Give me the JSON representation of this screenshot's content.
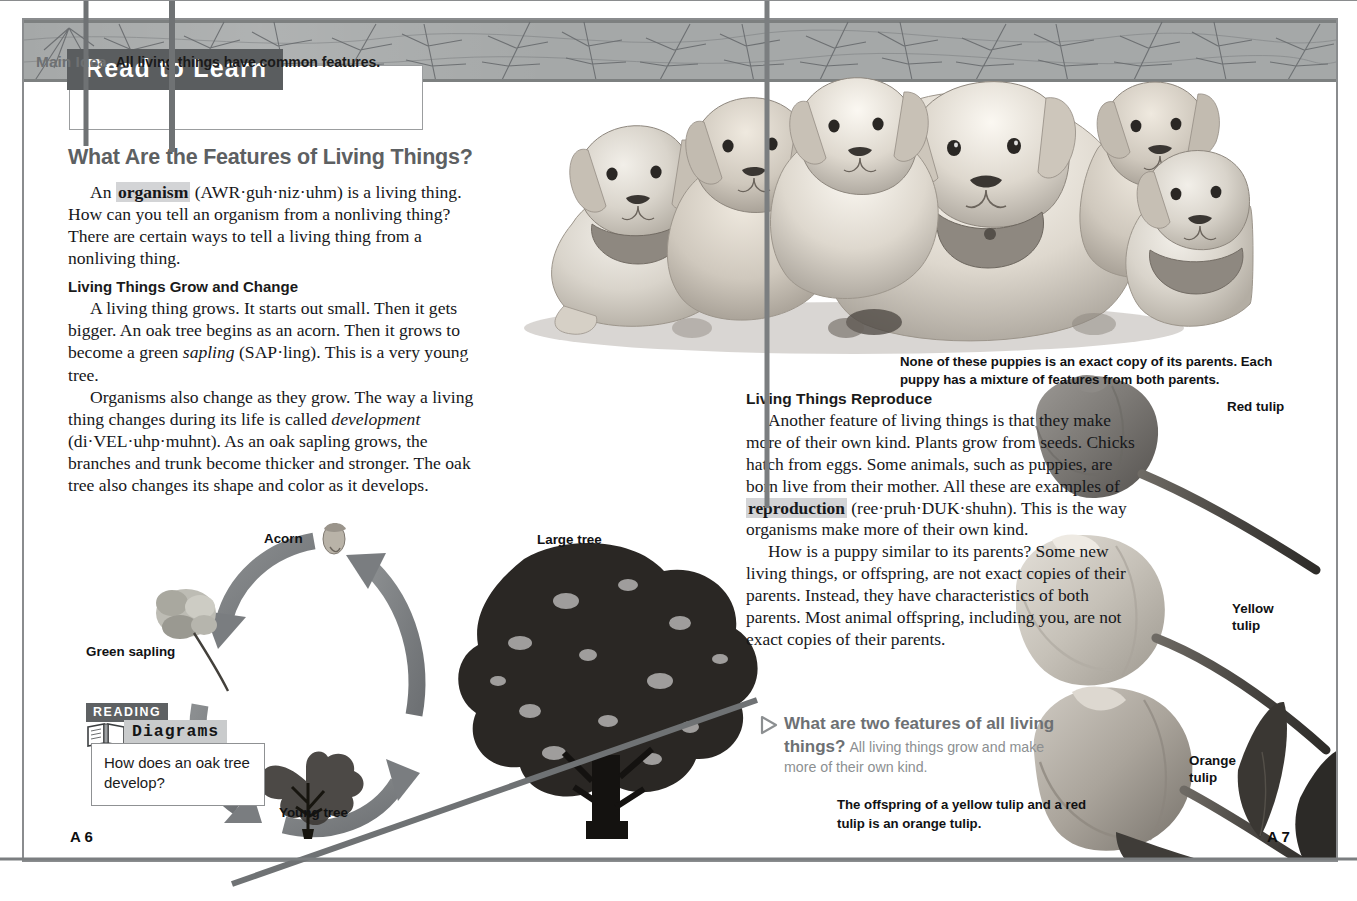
{
  "page": {
    "left_page_number": "A 6",
    "right_page_number": "A 7"
  },
  "header": {
    "tab_label": "Read to Learn",
    "main_idea_label": "Main Idea",
    "main_idea_text": "All living things have common features."
  },
  "left_column": {
    "section_heading": "What Are the Features of Living Things?",
    "paragraph_1_pre": "An ",
    "paragraph_1_keyword": "organism",
    "paragraph_1_post": " (AWR·guh·niz·uhm) is a living thing. How can you tell an organism from a nonliving thing? There are certain ways to tell a living thing from a nonliving thing.",
    "sub_heading": "Living Things Grow and Change",
    "paragraph_2_a": "A living thing grows. It starts out small. Then it gets bigger. An oak tree begins as an acorn. Then it grows to become a green ",
    "paragraph_2_italic": "sapling",
    "paragraph_2_b": " (SAP·ling). This is a very young tree.",
    "paragraph_3_a": "Organisms also change as they grow. The way a living thing changes during its life is called ",
    "paragraph_3_italic": "development",
    "paragraph_3_b": " (di·VEL·uhp·muhnt). As an oak sapling grows, the branches and trunk become thicker and stronger. The oak tree also changes its shape and color as it develops."
  },
  "right_column": {
    "sub_heading": "Living Things Reproduce",
    "paragraph_1_a": "Another feature of living things is that they make more of their own kind. Plants grow from seeds. Chicks hatch from eggs. Some animals, such as puppies, are born live from their mother. All these are examples of ",
    "paragraph_1_keyword": "reproduction",
    "paragraph_1_b": " (ree·pruh·DUK·shuhn). This is the way organisms make more of their own kind.",
    "paragraph_2": "How is a puppy similar to its parents? Some new living things, or offspring, are not exact copies of their parents. Instead, they have characteristics of both parents. Most animal offspring, including you, are not exact copies of their parents."
  },
  "question_callout": {
    "question": "What are two features of all living things?",
    "answer": "All living things grow and make more of their own kind.",
    "question_color": "#6d7073",
    "answer_color": "#8c8f91"
  },
  "captions": {
    "puppies": "None of these puppies is an exact copy of its parents. Each puppy has a mixture of features from both parents.",
    "tulips": "The offspring of a yellow tulip and a red tulip is an orange tulip."
  },
  "diagram": {
    "labels": {
      "acorn": "Acorn",
      "green_sapling": "Green sapling",
      "young_tree": "Young tree",
      "large_tree": "Large tree"
    }
  },
  "reading_box": {
    "tag_top": "READING",
    "tag_bottom": "Diagrams",
    "question": "How does an oak tree develop?"
  },
  "tulip_labels": {
    "red": "Red tulip",
    "yellow": "Yellow\ntulip",
    "yellow_line1": "Yellow",
    "yellow_line2": "tulip",
    "orange_line1": "Orange",
    "orange_line2": "tulip"
  },
  "colors": {
    "band": "#a5a8a8",
    "tab_bg": "#5a5d5f",
    "heading": "#5d6062",
    "keyword_highlight": "#d3d4d6",
    "arrow_gray": "#7e8183",
    "frame_border": "#8a8c8e",
    "overlay_line": "#7b7e80"
  }
}
